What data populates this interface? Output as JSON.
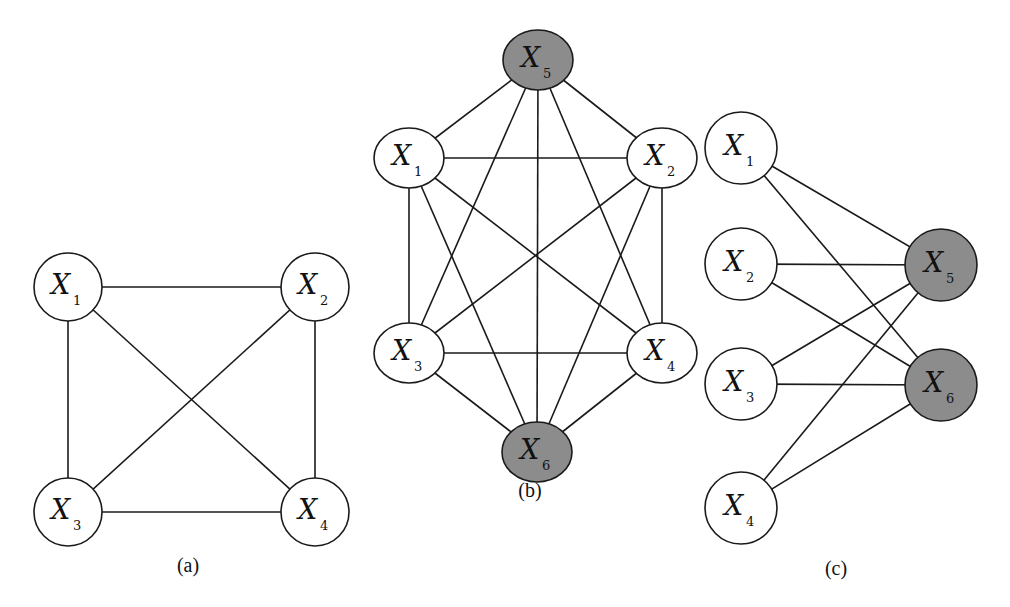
{
  "colors": {
    "plain_fill": "#ffffff",
    "shaded_fill": "#8c8c8c",
    "stroke": "#1a1a1a"
  },
  "graphs": [
    {
      "caption": "(a)",
      "caption_pos": [
        188,
        572
      ],
      "rx": 34,
      "ry": 34,
      "nodes": [
        {
          "id": "X1",
          "var": "X",
          "sub": "1",
          "x": 68,
          "y": 287,
          "shaded": false
        },
        {
          "id": "X2",
          "var": "X",
          "sub": "2",
          "x": 315,
          "y": 287,
          "shaded": false
        },
        {
          "id": "X3",
          "var": "X",
          "sub": "3",
          "x": 68,
          "y": 512,
          "shaded": false
        },
        {
          "id": "X4",
          "var": "X",
          "sub": "4",
          "x": 315,
          "y": 512,
          "shaded": false
        }
      ],
      "edges": [
        [
          "X1",
          "X2"
        ],
        [
          "X1",
          "X3"
        ],
        [
          "X1",
          "X4"
        ],
        [
          "X2",
          "X3"
        ],
        [
          "X2",
          "X4"
        ],
        [
          "X3",
          "X4"
        ]
      ]
    },
    {
      "caption": "(b)",
      "caption_pos": [
        530,
        497
      ],
      "rx": 35,
      "ry": 30,
      "nodes": [
        {
          "id": "X5",
          "var": "X",
          "sub": "5",
          "x": 538,
          "y": 60,
          "shaded": true
        },
        {
          "id": "X1",
          "var": "X",
          "sub": "1",
          "x": 409,
          "y": 158,
          "shaded": false
        },
        {
          "id": "X2",
          "var": "X",
          "sub": "2",
          "x": 662,
          "y": 158,
          "shaded": false
        },
        {
          "id": "X3",
          "var": "X",
          "sub": "3",
          "x": 409,
          "y": 353,
          "shaded": false
        },
        {
          "id": "X4",
          "var": "X",
          "sub": "4",
          "x": 662,
          "y": 353,
          "shaded": false
        },
        {
          "id": "X6",
          "var": "X",
          "sub": "6",
          "x": 537,
          "y": 452,
          "shaded": true
        }
      ],
      "edges": [
        [
          "X5",
          "X1"
        ],
        [
          "X5",
          "X2"
        ],
        [
          "X5",
          "X3"
        ],
        [
          "X5",
          "X4"
        ],
        [
          "X5",
          "X6"
        ],
        [
          "X1",
          "X2"
        ],
        [
          "X1",
          "X3"
        ],
        [
          "X1",
          "X4"
        ],
        [
          "X1",
          "X6"
        ],
        [
          "X2",
          "X3"
        ],
        [
          "X2",
          "X4"
        ],
        [
          "X2",
          "X6"
        ],
        [
          "X3",
          "X4"
        ],
        [
          "X3",
          "X6"
        ],
        [
          "X4",
          "X6"
        ]
      ]
    },
    {
      "caption": "(c)",
      "caption_pos": [
        836,
        575
      ],
      "rx": 36,
      "ry": 36,
      "nodes": [
        {
          "id": "X1",
          "var": "X",
          "sub": "1",
          "x": 741,
          "y": 148,
          "shaded": false
        },
        {
          "id": "X2",
          "var": "X",
          "sub": "2",
          "x": 741,
          "y": 264,
          "shaded": false
        },
        {
          "id": "X3",
          "var": "X",
          "sub": "3",
          "x": 741,
          "y": 384,
          "shaded": false
        },
        {
          "id": "X4",
          "var": "X",
          "sub": "4",
          "x": 741,
          "y": 508,
          "shaded": false
        },
        {
          "id": "X5",
          "var": "X",
          "sub": "5",
          "x": 941,
          "y": 265,
          "shaded": true
        },
        {
          "id": "X6",
          "var": "X",
          "sub": "6",
          "x": 941,
          "y": 385,
          "shaded": true
        }
      ],
      "edges": [
        [
          "X1",
          "X5"
        ],
        [
          "X1",
          "X6"
        ],
        [
          "X2",
          "X5"
        ],
        [
          "X2",
          "X6"
        ],
        [
          "X3",
          "X5"
        ],
        [
          "X3",
          "X6"
        ],
        [
          "X4",
          "X5"
        ],
        [
          "X4",
          "X6"
        ]
      ]
    }
  ]
}
